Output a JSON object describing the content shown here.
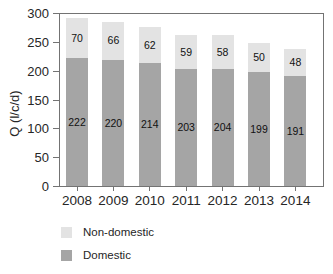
{
  "chart_data": {
    "type": "bar",
    "stacked": true,
    "title": "",
    "xlabel": "",
    "ylabel": "Q (l/c/d)",
    "categories": [
      "2008",
      "2009",
      "2010",
      "2011",
      "2012",
      "2013",
      "2014"
    ],
    "series": [
      {
        "name": "Domestic",
        "color": "#a5a5a5",
        "values": [
          222,
          220,
          214,
          203,
          204,
          199,
          191
        ]
      },
      {
        "name": "Non-domestic",
        "color": "#e3e3e3",
        "values": [
          70,
          66,
          62,
          59,
          58,
          50,
          48
        ]
      }
    ],
    "bar_labels_shown": true,
    "ylim": [
      0,
      300
    ],
    "ytick_step": 50,
    "yticks": [
      "0",
      "50",
      "100",
      "150",
      "200",
      "250",
      "300"
    ],
    "grid": false,
    "legend_position": "bottom-left",
    "legend": [
      {
        "label": "Non-domestic",
        "series": "Non-domestic"
      },
      {
        "label": "Domestic",
        "series": "Domestic"
      }
    ],
    "colors": {
      "axis": "#737373",
      "text": "#262626",
      "bar_label": "#111111",
      "background": "#ffffff"
    }
  }
}
